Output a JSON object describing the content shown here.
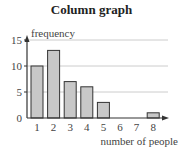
{
  "chart_data": {
    "type": "bar",
    "title": "Column graph",
    "xlabel": "number of people",
    "ylabel": "frequency",
    "categories": [
      "1",
      "2",
      "3",
      "4",
      "5",
      "6",
      "7",
      "8"
    ],
    "values": [
      10,
      13,
      7,
      6,
      3,
      0,
      0,
      1
    ],
    "yticks": [
      "0",
      "5",
      "10",
      "15"
    ],
    "ylim": [
      0,
      15
    ],
    "grid": true,
    "legend": null,
    "colors": {
      "bar_fill": "#c8c8c8",
      "bar_stroke": "#333333",
      "grid": "#cccccc",
      "axis": "#333333"
    }
  }
}
